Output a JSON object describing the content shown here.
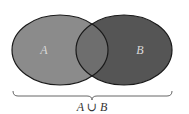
{
  "diagram": {
    "type": "venn",
    "sets": [
      {
        "id": "A",
        "label": "A",
        "fill": "#8b8b8b",
        "cx": 60,
        "cy": 50,
        "rx": 48,
        "ry": 35
      },
      {
        "id": "B",
        "label": "B",
        "fill": "#555555",
        "cx": 124,
        "cy": 50,
        "rx": 48,
        "ry": 35
      }
    ],
    "intersection": {
      "fill": "#6e6e6e"
    },
    "outline_color": "#1a1a1a",
    "label_color": "#d9d9d9",
    "brace": {
      "x_start": 13,
      "x_end": 172,
      "y": 91,
      "color": "#666666"
    },
    "caption": {
      "left": "A",
      "operator": "∪",
      "right": "B",
      "text": "A ∪ B"
    }
  }
}
